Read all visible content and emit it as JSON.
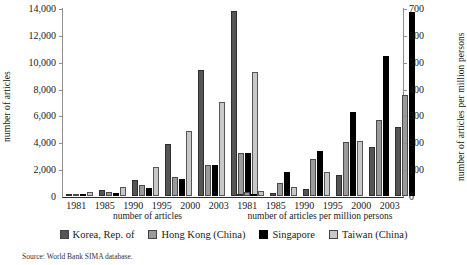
{
  "axes": {
    "left_title": "number of articles",
    "right_title": "number of articles per million persons",
    "left_ticks": [
      "14,000",
      "12,000",
      "10,000",
      "8,000",
      "6,000",
      "4,000",
      "2,000",
      "0"
    ],
    "right_ticks": [
      "700",
      "600",
      "500",
      "400",
      "300",
      "200",
      "100",
      "0"
    ],
    "panel_left_title": "number of articles",
    "panel_right_title": "number of articles per million persons"
  },
  "legend": {
    "items": [
      {
        "label": "Korea, Rep. of",
        "color": "#555555"
      },
      {
        "label": "Hong Kong (China)",
        "color": "#9a9a9a"
      },
      {
        "label": "Singapore",
        "color": "#000000"
      },
      {
        "label": "Taiwan (China)",
        "color": "#c8c8c8"
      }
    ]
  },
  "source": "Source: World Bank SIMA database.",
  "chart_data": {
    "type": "bar",
    "title": "",
    "panels": [
      {
        "name": "number of articles",
        "ylabel": "number of articles",
        "ylim": [
          0,
          14000
        ],
        "ytick_step": 2000,
        "categories": [
          "1981",
          "1985",
          "1990",
          "1995",
          "2000",
          "2003"
        ],
        "series": [
          {
            "name": "Korea, Rep. of",
            "color": "#555555",
            "values": [
              150,
              430,
              1180,
              3850,
              9350,
              13800
            ]
          },
          {
            "name": "Hong Kong (China)",
            "color": "#9a9a9a",
            "values": [
              90,
              300,
              790,
              1400,
              2300,
              3200
            ]
          },
          {
            "name": "Singapore",
            "color": "#000000",
            "values": [
              60,
              260,
              600,
              1300,
              2300,
              3200
            ]
          },
          {
            "name": "Taiwan (China)",
            "color": "#c8c8c8",
            "values": [
              300,
              660,
              2150,
              4850,
              7020,
              9250
            ]
          }
        ]
      },
      {
        "name": "number of articles per million persons",
        "ylabel": "number of articles per million persons",
        "ylim": [
          0,
          760
        ],
        "ytick_step": 100,
        "categories": [
          "1981",
          "1985",
          "1990",
          "1995",
          "2000",
          "2003"
        ],
        "series": [
          {
            "name": "Korea, Rep. of",
            "color": "#555555",
            "values": [
              4,
              11,
              28,
              83,
              198,
              277
            ]
          },
          {
            "name": "Hong Kong (China)",
            "color": "#9a9a9a",
            "values": [
              17,
              53,
              148,
              218,
              308,
              408
            ]
          },
          {
            "name": "Singapore",
            "color": "#000000",
            "values": [
              8,
              99,
              182,
              340,
              565,
              745
            ]
          },
          {
            "name": "Taiwan (China)",
            "color": "#c8c8c8",
            "values": [
              22,
              36,
              97,
              222,
              0,
              0
            ]
          }
        ]
      }
    ],
    "xlabel": "",
    "grid": false,
    "legend_position": "bottom"
  }
}
